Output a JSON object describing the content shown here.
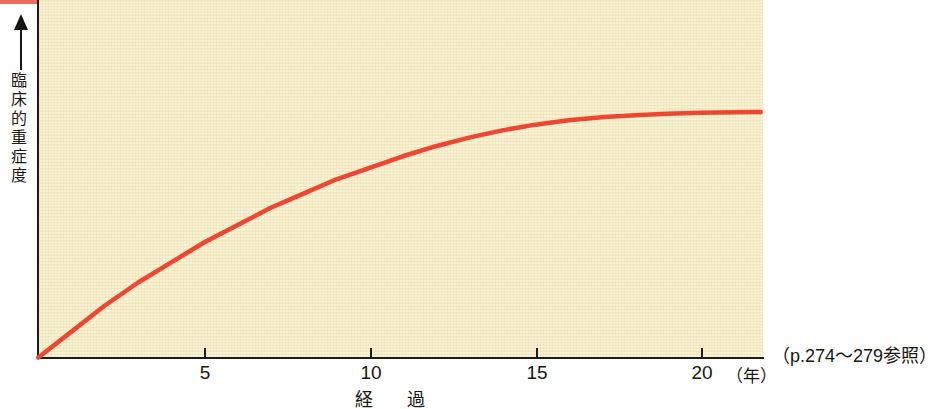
{
  "figure": {
    "background_color": "#ffffff",
    "plot_background_color": "#f8f1d2",
    "axis_color": "#1d1d18",
    "curve_color": "#ef4631",
    "accent_rule_color": "#ee6a5c"
  },
  "axes": {
    "y_title": "臨床的重症度",
    "y_title_chars": [
      "臨",
      "床",
      "的",
      "重",
      "症",
      "度"
    ],
    "x_title": "経　過",
    "x_unit": "（年）",
    "x_ticks": [
      {
        "value": 5,
        "label": "5"
      },
      {
        "value": 10,
        "label": "10"
      },
      {
        "value": 15,
        "label": "15"
      },
      {
        "value": 20,
        "label": "20"
      }
    ]
  },
  "annotations": {
    "reference_note": "（p.274〜279参照）"
  },
  "chart_data": {
    "type": "line",
    "title": "",
    "subtitle": "",
    "xlabel": "経　過（年）",
    "ylabel": "臨床的重症度",
    "xlim": [
      0,
      22
    ],
    "ylim": [
      0,
      1
    ],
    "grid": false,
    "legend": null,
    "series": [
      {
        "name": "臨床的重症度",
        "color": "#ef4631",
        "x": [
          0,
          1,
          2,
          3,
          4,
          5,
          6,
          7,
          8,
          9,
          10,
          11,
          12,
          13,
          14,
          15,
          16,
          17,
          18,
          19,
          20,
          21,
          21.8
        ],
        "y": [
          0.0,
          0.09,
          0.18,
          0.26,
          0.33,
          0.4,
          0.46,
          0.52,
          0.57,
          0.62,
          0.66,
          0.7,
          0.735,
          0.765,
          0.79,
          0.81,
          0.825,
          0.836,
          0.843,
          0.848,
          0.851,
          0.853,
          0.854
        ]
      }
    ],
    "annotations": [
      "（p.274〜279参照）"
    ]
  }
}
